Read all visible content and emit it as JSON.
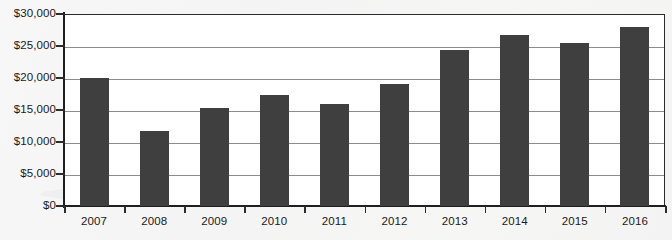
{
  "chart_data": {
    "type": "bar",
    "title": "",
    "subtitle": "",
    "xlabel": "",
    "ylabel": "",
    "categories": [
      "2007",
      "2008",
      "2009",
      "2010",
      "2011",
      "2012",
      "2013",
      "2014",
      "2015",
      "2016"
    ],
    "values": [
      20000,
      11700,
      15300,
      17400,
      15900,
      19100,
      24400,
      26700,
      25500,
      27900
    ],
    "series": [
      {
        "name": "",
        "values": [
          20000,
          11700,
          15300,
          17400,
          15900,
          19100,
          24400,
          26700,
          25500,
          27900
        ]
      }
    ],
    "ylim": [
      0,
      30000
    ],
    "ytick_values": [
      0,
      5000,
      10000,
      15000,
      20000,
      25000,
      30000
    ],
    "ytick_labels": [
      "$0",
      "$5,000",
      "$10,000",
      "$15,000",
      "$20,000",
      "$25,000",
      "$30,000"
    ],
    "grid": true,
    "grid_axis": "y",
    "legend": false,
    "legend_position": "none",
    "annotations": [],
    "bar_color": "#3f3f3f",
    "plot_background": "#ffffff",
    "page_background": "#f5f5f5",
    "axis_color": "#1f1f1f",
    "gridline_color": "#8c8c8c"
  }
}
